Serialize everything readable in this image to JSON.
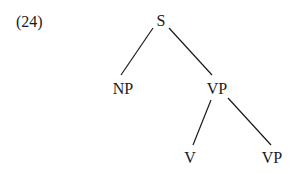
{
  "example_number": "(24)",
  "tree": {
    "nodes": {
      "S": {
        "label": "S"
      },
      "NP": {
        "label": "NP"
      },
      "VP1": {
        "label": "VP"
      },
      "V": {
        "label": "V"
      },
      "VP2": {
        "label": "VP"
      }
    },
    "edges": [
      [
        "S",
        "NP"
      ],
      [
        "S",
        "VP1"
      ],
      [
        "VP1",
        "V"
      ],
      [
        "VP1",
        "VP2"
      ]
    ]
  }
}
